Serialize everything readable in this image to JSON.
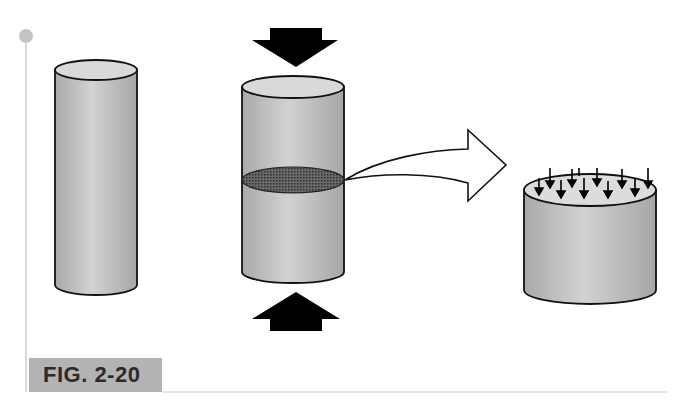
{
  "figure": {
    "label": "FIG. 2-20",
    "label_bg_color": "#b3b3b3",
    "frame_line_color": "#c8c8c8",
    "dot_color": "#c4c4c4"
  },
  "panels": [
    {
      "id": "column",
      "description": "tall cylinder (column)"
    },
    {
      "id": "compressed-column",
      "description": "cylinder under compressive force with cut cross-section",
      "force_arrows": [
        "down (top)",
        "up (bottom)"
      ]
    },
    {
      "id": "cross-section",
      "description": "cut section showing distributed stress arrows",
      "stress_arrow_count": 11
    }
  ],
  "colors": {
    "cylinder_fill": "#bdbdbd",
    "cylinder_top": "#d9d9d9",
    "outline": "#111111",
    "section_fill": "#555555",
    "arrow_fill": "#000000"
  }
}
